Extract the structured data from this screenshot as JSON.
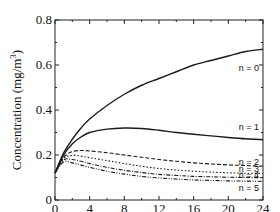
{
  "chart_data": {
    "type": "line",
    "title": "",
    "xlabel": "Time (h)",
    "ylabel": "Concentration (mg/m3)",
    "ylabel_parts": {
      "main": "Concentration (mg/m",
      "sup": "3",
      "end": ")"
    },
    "xlim": [
      0,
      24
    ],
    "ylim": [
      0,
      0.8
    ],
    "xticks": [
      0,
      4,
      8,
      12,
      16,
      20,
      24
    ],
    "yticks": [
      0,
      0.2,
      0.4,
      0.6,
      0.8
    ],
    "ytick_labels": [
      "0",
      "0.2",
      "0.4",
      "0.6",
      "0.8"
    ],
    "grid": false,
    "legend_position": "inline-right",
    "x": [
      0,
      1,
      2,
      3,
      4,
      6,
      8,
      10,
      12,
      14,
      16,
      18,
      20,
      22,
      24
    ],
    "series": [
      {
        "name": "n = 0",
        "style": "solid",
        "values": [
          0.12,
          0.21,
          0.27,
          0.32,
          0.36,
          0.42,
          0.47,
          0.51,
          0.54,
          0.57,
          0.6,
          0.62,
          0.64,
          0.66,
          0.67
        ]
      },
      {
        "name": "n = 1",
        "style": "solid",
        "values": [
          0.12,
          0.2,
          0.25,
          0.28,
          0.3,
          0.315,
          0.32,
          0.318,
          0.31,
          0.3,
          0.292,
          0.285,
          0.278,
          0.272,
          0.268
        ]
      },
      {
        "name": "n = 2",
        "style": "dashed",
        "values": [
          0.12,
          0.19,
          0.215,
          0.22,
          0.218,
          0.21,
          0.2,
          0.19,
          0.18,
          0.172,
          0.165,
          0.16,
          0.156,
          0.153,
          0.15
        ]
      },
      {
        "name": "n = 3",
        "style": "dotted",
        "values": [
          0.12,
          0.185,
          0.198,
          0.195,
          0.188,
          0.175,
          0.162,
          0.15,
          0.14,
          0.133,
          0.128,
          0.124,
          0.121,
          0.119,
          0.118
        ]
      },
      {
        "name": "n = 4",
        "style": "dashdot",
        "values": [
          0.12,
          0.178,
          0.18,
          0.172,
          0.162,
          0.145,
          0.132,
          0.122,
          0.114,
          0.109,
          0.105,
          0.103,
          0.101,
          0.1,
          0.099
        ]
      },
      {
        "name": "n = 5",
        "style": "dashdotdot",
        "values": [
          0.12,
          0.17,
          0.165,
          0.155,
          0.145,
          0.128,
          0.115,
          0.105,
          0.098,
          0.093,
          0.089,
          0.087,
          0.085,
          0.084,
          0.083
        ]
      }
    ]
  }
}
